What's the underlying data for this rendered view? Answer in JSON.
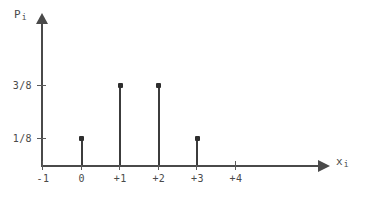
{
  "chart_data": {
    "type": "bar",
    "title": "",
    "subtitle": "",
    "xlabel": "x_i",
    "ylabel": "P_i",
    "xlabel_base": "x",
    "xlabel_sub": "i",
    "ylabel_base": "P",
    "ylabel_sub": "i",
    "grid": false,
    "legend": false,
    "xlim": [
      -1.6,
      4.9
    ],
    "ylim": [
      0,
      0.53
    ],
    "categories": [
      "-1",
      "0",
      "+1",
      "+2",
      "+3",
      "+4"
    ],
    "x": [
      -1,
      0,
      1,
      2,
      3,
      4
    ],
    "values": [
      0,
      0.125,
      0.375,
      0.375,
      0.125,
      0
    ],
    "value_labels": [
      "0",
      "1/8",
      "3/8",
      "3/8",
      "1/8",
      "0"
    ],
    "xtick_labels": [
      "-1",
      "0",
      "+1",
      "+2",
      "+3",
      "+4"
    ],
    "ytick_labels": [
      "1/8",
      "3/8"
    ],
    "ytick_values": [
      0.125,
      0.375
    ],
    "annotations": []
  },
  "axes": {
    "y_title": "P",
    "y_title_sub": "i",
    "x_title": "x",
    "x_title_sub": "i"
  },
  "style": {
    "background": "#ffffff",
    "axis_color": "#4a4a4a",
    "stem_color": "#3c3c3c",
    "marker_color": "#2e2e2e",
    "text_color": "#4a4a4a"
  }
}
